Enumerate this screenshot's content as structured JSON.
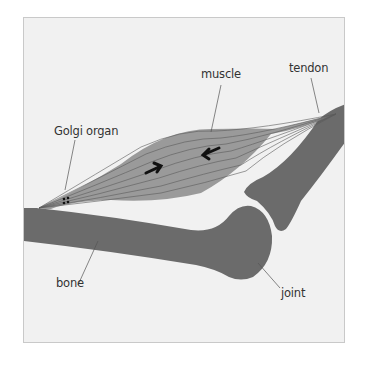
{
  "diagram": {
    "labels": {
      "muscle": "muscle",
      "tendon": "tendon",
      "golgi": "Golgi organ",
      "bone": "bone",
      "joint": "joint"
    },
    "colors": {
      "background": "#f1f1f1",
      "bone": "#6b6b6b",
      "muscle": "#9a9a9a",
      "fiber_lines": "#5a5a5a",
      "arrows": "#111111",
      "leader_lines": "#555555"
    }
  }
}
